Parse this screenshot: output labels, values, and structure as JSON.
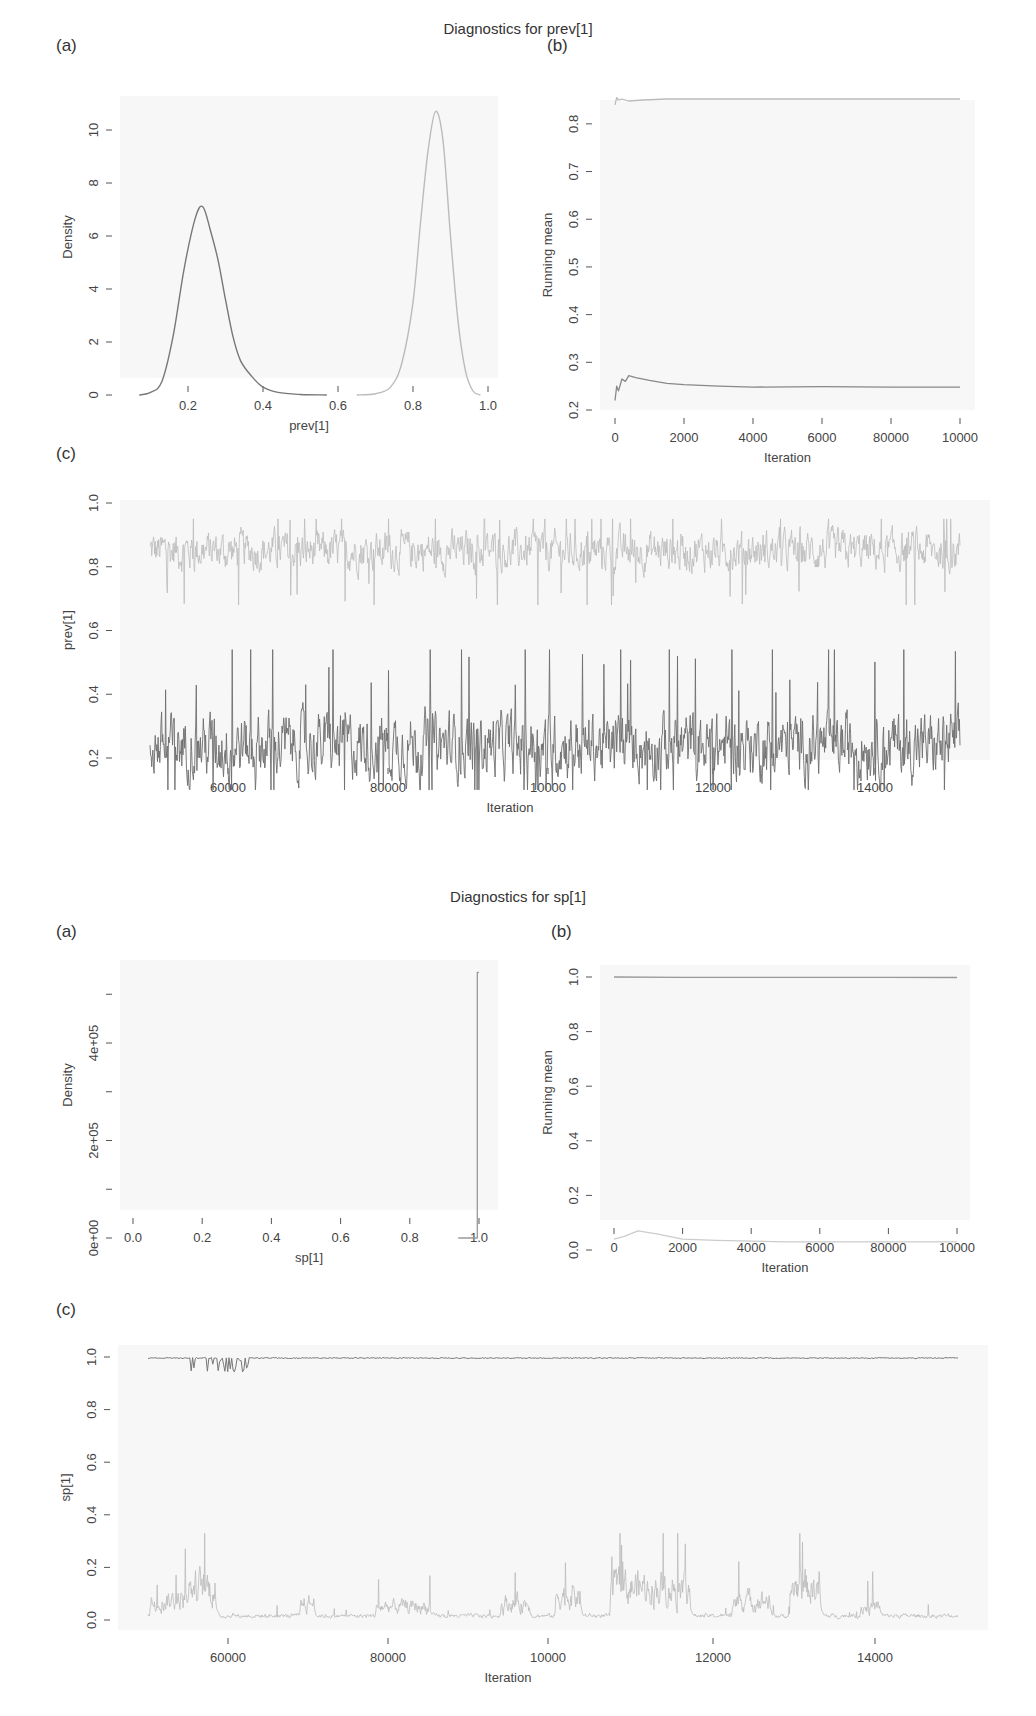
{
  "sections": [
    {
      "title": "Diagnostics for prev[1]",
      "panel_labels": [
        "(a)",
        "(b)",
        "(c)"
      ],
      "a": {
        "xlabel": "prev[1]",
        "ylabel": "Density",
        "xticks": [
          "0.2",
          "0.4",
          "0.6",
          "0.8",
          "1.0"
        ],
        "yticks": [
          "0",
          "2",
          "4",
          "6",
          "8",
          "10"
        ]
      },
      "b": {
        "xlabel": "Iteration",
        "ylabel": "Running mean",
        "xticks": [
          "0",
          "2000",
          "4000",
          "6000",
          "80000",
          "10000"
        ],
        "yticks": [
          "0.2",
          "0.3",
          "0.4",
          "0.5",
          "0.6",
          "0.7",
          "0.8"
        ]
      },
      "c": {
        "xlabel": "Iteration",
        "ylabel": "prev[1]",
        "xticks": [
          "60000",
          "80000",
          "10000",
          "12000",
          "14000"
        ],
        "yticks": [
          "0.2",
          "0.4",
          "0.6",
          "0.8",
          "1.0"
        ]
      }
    },
    {
      "title": "Diagnostics for sp[1]",
      "panel_labels": [
        "(a)",
        "(b)",
        "(c)"
      ],
      "a": {
        "xlabel": "sp[1]",
        "ylabel": "Density",
        "xticks": [
          "0.0",
          "0.2",
          "0.4",
          "0.6",
          "0.8",
          "1.0"
        ],
        "yticks": [
          "0e+00",
          "",
          "2e+05",
          "",
          "4e+05",
          ""
        ]
      },
      "b": {
        "xlabel": "Iteration",
        "ylabel": "Running mean",
        "xticks": [
          "0",
          "2000",
          "4000",
          "6000",
          "80000",
          "10000"
        ],
        "yticks": [
          "0.0",
          "0.2",
          "0.4",
          "0.6",
          "0.8",
          "1.0"
        ]
      },
      "c": {
        "xlabel": "Iteration",
        "ylabel": "sp[1]",
        "xticks": [
          "60000",
          "80000",
          "10000",
          "12000",
          "14000"
        ],
        "yticks": [
          "0.0",
          "0.2",
          "0.4",
          "0.6",
          "0.8",
          "1.0"
        ]
      }
    }
  ],
  "chart_data": [
    {
      "id": "prev1-a",
      "type": "line",
      "title": "Diagnostics for prev[1] (a)",
      "xlabel": "prev[1]",
      "ylabel": "Density",
      "xlim": [
        0.05,
        1.0
      ],
      "ylim": [
        0,
        11
      ],
      "series": [
        {
          "name": "chain 1 (dark)",
          "color": "#777777",
          "x": [
            0.07,
            0.1,
            0.13,
            0.16,
            0.19,
            0.22,
            0.24,
            0.26,
            0.28,
            0.3,
            0.32,
            0.34,
            0.37,
            0.4,
            0.44,
            0.5,
            0.57
          ],
          "y": [
            0,
            0.1,
            0.5,
            2.2,
            4.8,
            6.7,
            7.1,
            6.2,
            5.1,
            3.6,
            2.2,
            1.3,
            0.7,
            0.3,
            0.1,
            0.02,
            0
          ]
        },
        {
          "name": "chain 2 (light)",
          "color": "#bbbbbb",
          "x": [
            0.65,
            0.7,
            0.74,
            0.77,
            0.8,
            0.82,
            0.84,
            0.86,
            0.88,
            0.9,
            0.92,
            0.94,
            0.96,
            0.98
          ],
          "y": [
            0,
            0.05,
            0.3,
            1.2,
            3.5,
            6.5,
            9.2,
            10.7,
            9.6,
            6.0,
            2.8,
            0.9,
            0.15,
            0
          ]
        }
      ]
    },
    {
      "id": "prev1-b",
      "type": "line",
      "title": "Diagnostics for prev[1] (b)",
      "xlabel": "Iteration",
      "ylabel": "Running mean",
      "xlim": [
        0,
        10000
      ],
      "ylim": [
        0.2,
        0.85
      ],
      "series": [
        {
          "name": "chain 2 (light)",
          "color": "#bbbbbb",
          "x": [
            0,
            50,
            100,
            200,
            400,
            800,
            1500,
            3000,
            6000,
            10000
          ],
          "y": [
            0.84,
            0.855,
            0.85,
            0.852,
            0.848,
            0.85,
            0.852,
            0.852,
            0.852,
            0.852
          ]
        },
        {
          "name": "chain 1 (dark)",
          "color": "#888888",
          "x": [
            0,
            50,
            100,
            200,
            300,
            400,
            600,
            1000,
            1500,
            2000,
            3000,
            4000,
            6000,
            8000,
            10000
          ],
          "y": [
            0.22,
            0.25,
            0.24,
            0.265,
            0.26,
            0.272,
            0.268,
            0.262,
            0.256,
            0.253,
            0.25,
            0.248,
            0.249,
            0.248,
            0.248
          ]
        }
      ]
    },
    {
      "id": "prev1-c",
      "type": "line",
      "title": "Diagnostics for prev[1] (c) trace",
      "xlabel": "Iteration",
      "ylabel": "prev[1]",
      "ylim": [
        0.1,
        1.0
      ],
      "series": [
        {
          "name": "chain 2 (light)",
          "color": "#bbbbbb",
          "mean": 0.85,
          "min": 0.68,
          "max": 0.95
        },
        {
          "name": "chain 1 (dark)",
          "color": "#6e6e6e",
          "mean": 0.24,
          "min": 0.1,
          "max": 0.54
        }
      ]
    },
    {
      "id": "sp1-a",
      "type": "line",
      "title": "Diagnostics for sp[1] (a)",
      "xlabel": "sp[1]",
      "ylabel": "Density",
      "xlim": [
        0,
        1.0
      ],
      "ylim": [
        0,
        550000
      ],
      "series": [
        {
          "name": "chain 1",
          "color": "#999999",
          "x": [
            0.94,
            0.99,
            0.995,
            0.995,
            1.0
          ],
          "y": [
            0,
            0,
            0,
            545000,
            545000
          ]
        }
      ]
    },
    {
      "id": "sp1-b",
      "type": "line",
      "title": "Diagnostics for sp[1] (b)",
      "xlabel": "Iteration",
      "ylabel": "Running mean",
      "xlim": [
        0,
        10000
      ],
      "ylim": [
        0,
        1.0
      ],
      "series": [
        {
          "name": "chain 1 (dark)",
          "color": "#999999",
          "x": [
            0,
            2000,
            4000,
            6000,
            8000,
            10000
          ],
          "y": [
            1.0,
            0.999,
            0.999,
            0.999,
            0.999,
            0.998
          ]
        },
        {
          "name": "chain 2 (light)",
          "color": "#cccccc",
          "x": [
            0,
            300,
            700,
            1200,
            2000,
            3000,
            5000,
            8000,
            10000
          ],
          "y": [
            0.04,
            0.05,
            0.07,
            0.06,
            0.04,
            0.035,
            0.03,
            0.03,
            0.03
          ]
        }
      ]
    },
    {
      "id": "sp1-c",
      "type": "line",
      "title": "Diagnostics for sp[1] (c) trace",
      "xlabel": "Iteration",
      "ylabel": "sp[1]",
      "ylim": [
        -0.02,
        1.02
      ],
      "series": [
        {
          "name": "chain 1 (dark)",
          "color": "#777777",
          "mean": 0.998,
          "min": 0.94,
          "max": 1.0
        },
        {
          "name": "chain 2 (light)",
          "color": "#bbbbbb",
          "mean": 0.03,
          "min": 0.0,
          "max": 0.33
        }
      ]
    }
  ]
}
